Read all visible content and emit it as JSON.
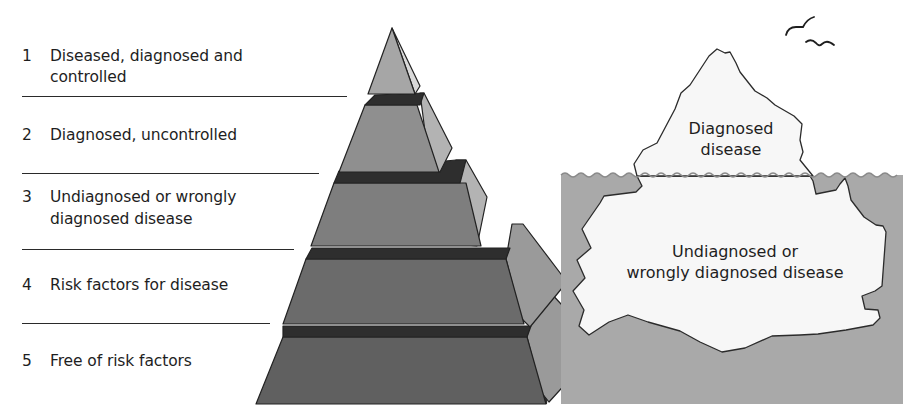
{
  "pyramid": {
    "tiers": [
      {
        "number": "1",
        "line1": "Diseased, diagnosed and",
        "line2": "controlled"
      },
      {
        "number": "2",
        "line1": "Diagnosed, uncontrolled",
        "line2": ""
      },
      {
        "number": "3",
        "line1": "Undiagnosed or wrongly",
        "line2": "diagnosed disease"
      },
      {
        "number": "4",
        "line1": "Risk factors for disease",
        "line2": ""
      },
      {
        "number": "5",
        "line1": "Free of risk factors",
        "line2": ""
      }
    ],
    "colors": {
      "tier1_front": "#a6a6a6",
      "tier2_front": "#8f8f8f",
      "tier3_front": "#7e7e7e",
      "tier4_front": "#6b6b6b",
      "tier5_front": "#606060",
      "side_light": "#b3b3b3",
      "side_mid": "#9a9a9a",
      "top_dark": "#2e2e2e",
      "outline": "#222222"
    }
  },
  "iceberg": {
    "above_water_label": {
      "line1": "Diagnosed",
      "line2": "disease"
    },
    "below_water_label": {
      "line1": "Undiagnosed or",
      "line2": "wrongly diagnosed disease"
    },
    "colors": {
      "water": "#a9a9a9",
      "ice": "#f7f7f7",
      "outline": "#2b2b2b"
    }
  }
}
